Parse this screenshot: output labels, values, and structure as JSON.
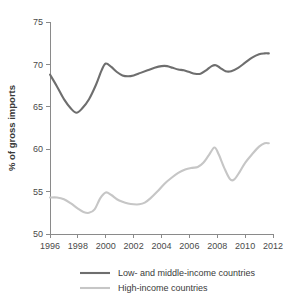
{
  "chart_data": {
    "type": "line",
    "title": "",
    "subtitle": "",
    "xlabel": "",
    "ylabel": "% of gross imports",
    "xlim": [
      1996,
      2012
    ],
    "ylim": [
      50,
      75
    ],
    "grid": false,
    "legend_position": "bottom",
    "xticks": [
      1996,
      1998,
      2000,
      2002,
      2004,
      2006,
      2008,
      2010,
      2012
    ],
    "xtick_labels": [
      "1996",
      "1998",
      "2000",
      "2002",
      "2004",
      "2006",
      "2008",
      "2010",
      "2012"
    ],
    "yticks": [
      50,
      55,
      60,
      65,
      70,
      75
    ],
    "ytick_labels": [
      "50",
      "55",
      "60",
      "65",
      "70",
      "75"
    ],
    "series": [
      {
        "name": "Low- and middle-income countries",
        "color": "#6e6e6e",
        "x": [
          1996.0,
          1996.5,
          1997.0,
          1997.5,
          1997.9,
          1998.3,
          1998.8,
          1999.3,
          1999.7,
          2000.0,
          2000.4,
          2000.8,
          2001.2,
          2001.6,
          2002.0,
          2002.5,
          2003.0,
          2003.5,
          2004.0,
          2004.4,
          2004.8,
          2005.2,
          2005.6,
          2006.0,
          2006.4,
          2006.8,
          2007.2,
          2007.6,
          2007.9,
          2008.2,
          2008.6,
          2009.0,
          2009.5,
          2010.0,
          2010.5,
          2011.0,
          2011.4,
          2011.7
        ],
        "values": [
          68.8,
          67.4,
          65.9,
          64.8,
          64.3,
          64.8,
          65.9,
          67.6,
          69.3,
          70.1,
          69.7,
          69.1,
          68.7,
          68.6,
          68.7,
          69.0,
          69.3,
          69.6,
          69.8,
          69.8,
          69.6,
          69.4,
          69.3,
          69.1,
          68.9,
          68.9,
          69.3,
          69.8,
          69.9,
          69.6,
          69.2,
          69.2,
          69.6,
          70.2,
          70.8,
          71.2,
          71.3,
          71.3
        ]
      },
      {
        "name": "High-income countries",
        "color": "#c6c6c6",
        "x": [
          1996.0,
          1996.5,
          1997.0,
          1997.5,
          1998.0,
          1998.4,
          1998.8,
          1999.2,
          1999.6,
          2000.0,
          2000.4,
          2000.8,
          2001.2,
          2001.6,
          2002.0,
          2002.4,
          2002.8,
          2003.2,
          2003.7,
          2004.2,
          2004.7,
          2005.2,
          2005.7,
          2006.2,
          2006.6,
          2007.0,
          2007.4,
          2007.8,
          2008.1,
          2008.5,
          2008.9,
          2009.2,
          2009.6,
          2010.0,
          2010.5,
          2011.0,
          2011.4,
          2011.7
        ],
        "values": [
          54.3,
          54.3,
          54.1,
          53.6,
          53.0,
          52.6,
          52.5,
          52.9,
          54.2,
          54.9,
          54.6,
          54.1,
          53.8,
          53.6,
          53.5,
          53.5,
          53.7,
          54.2,
          55.0,
          55.9,
          56.6,
          57.2,
          57.6,
          57.8,
          57.9,
          58.4,
          59.3,
          60.2,
          59.4,
          57.8,
          56.5,
          56.4,
          57.3,
          58.4,
          59.4,
          60.3,
          60.7,
          60.7
        ]
      }
    ],
    "legend": [
      {
        "label": "Low- and middle-income countries",
        "color": "#6e6e6e"
      },
      {
        "label": "High-income countries",
        "color": "#c6c6c6"
      }
    ]
  },
  "colors": {
    "background": "#ffffff",
    "axis": "#8a8a8a",
    "text": "#3a3a3a",
    "series_low_middle": "#6e6e6e",
    "series_high": "#c6c6c6"
  }
}
